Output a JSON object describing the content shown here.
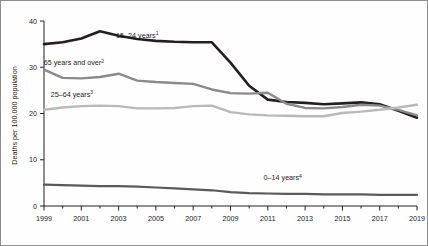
{
  "chart_data": {
    "type": "line",
    "title": "",
    "xlabel": "",
    "ylabel": "Deaths per 100,000 population",
    "xlim": [
      1999,
      2019
    ],
    "ylim": [
      0,
      40
    ],
    "yticks": [
      0,
      10,
      20,
      30,
      40
    ],
    "ytick_labels": [
      "0",
      "10",
      "20",
      "30",
      "40"
    ],
    "x": [
      1999,
      2000,
      2001,
      2002,
      2003,
      2004,
      2005,
      2006,
      2007,
      2008,
      2009,
      2010,
      2011,
      2012,
      2013,
      2014,
      2015,
      2016,
      2017,
      2018,
      2019
    ],
    "xtick_labels": [
      "1999",
      "2001",
      "2003",
      "2005",
      "2007",
      "2009",
      "2011",
      "2013",
      "2015",
      "2017",
      "2019"
    ],
    "xticks_major": [
      1999,
      2001,
      2003,
      2005,
      2007,
      2009,
      2011,
      2013,
      2015,
      2017,
      2019
    ],
    "xticks_minor": [
      2000,
      2002,
      2004,
      2006,
      2008,
      2010,
      2012,
      2014,
      2016,
      2018
    ],
    "grid": false,
    "legend_position": "inline-annotations",
    "series": [
      {
        "name": "15-24 years",
        "label": "15–24 years",
        "footnote": "1",
        "color": "#231f20",
        "width": 2.6,
        "label_x": 2004.0,
        "label_y": 36.4,
        "values": [
          35.0,
          35.4,
          36.2,
          37.8,
          36.8,
          36.1,
          35.7,
          35.5,
          35.4,
          35.4,
          31.0,
          26.0,
          23.0,
          22.5,
          22.3,
          22.0,
          22.2,
          22.4,
          22.0,
          20.6,
          19.1
        ]
      },
      {
        "name": "65 years and over",
        "label": "65 years and over",
        "footnote": "2",
        "color": "#8a8a8a",
        "width": 2.4,
        "label_x": 2000.6,
        "label_y": 30.4,
        "values": [
          29.5,
          27.7,
          27.6,
          27.9,
          28.6,
          27.1,
          26.8,
          26.6,
          26.4,
          25.2,
          24.4,
          24.3,
          24.5,
          22.1,
          21.2,
          21.1,
          21.4,
          21.9,
          21.7,
          20.8,
          19.6
        ]
      },
      {
        "name": "25-64 years",
        "label": "25–64 years",
        "footnote": "3",
        "color": "#b9b9b9",
        "width": 2.4,
        "label_x": 2000.5,
        "label_y": 23.6,
        "values": [
          20.8,
          21.3,
          21.6,
          21.7,
          21.6,
          21.1,
          21.1,
          21.2,
          21.6,
          21.7,
          20.3,
          19.8,
          19.6,
          19.5,
          19.4,
          19.4,
          20.1,
          20.4,
          20.8,
          21.3,
          21.9
        ]
      },
      {
        "name": "0-14 years",
        "label": "0–14 years",
        "footnote": "4",
        "color": "#5a5a5a",
        "width": 2.2,
        "label_x": 2011.8,
        "label_y": 5.6,
        "values": [
          4.6,
          4.5,
          4.4,
          4.3,
          4.3,
          4.2,
          4.0,
          3.8,
          3.6,
          3.4,
          3.0,
          2.8,
          2.7,
          2.6,
          2.6,
          2.5,
          2.5,
          2.5,
          2.4,
          2.4,
          2.4
        ]
      }
    ]
  }
}
